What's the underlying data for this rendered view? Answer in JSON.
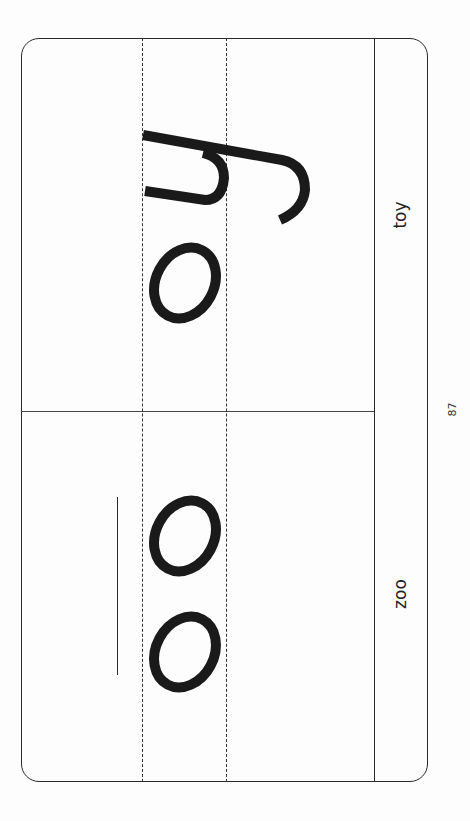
{
  "worksheet": {
    "page_number": "87",
    "orientation": "rotated-90",
    "panels": [
      {
        "word": "toy",
        "letters": [
          "y",
          "o"
        ],
        "position": "top"
      },
      {
        "word": "zoo",
        "letters": [
          "o",
          "o"
        ],
        "position": "bottom"
      }
    ],
    "colors": {
      "stroke": "#1a1a1a",
      "lines": "#2a2a2a",
      "background": "#fdfdfd"
    }
  }
}
